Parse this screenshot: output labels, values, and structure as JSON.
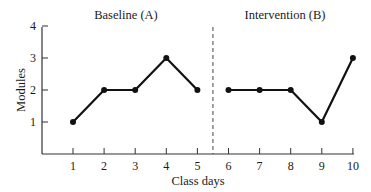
{
  "chart_data": {
    "type": "line",
    "title": "",
    "xlabel": "Class days",
    "ylabel": "Modules",
    "x": [
      1,
      2,
      3,
      4,
      5,
      6,
      7,
      8,
      9,
      10
    ],
    "series": [
      {
        "name": "Baseline (A)",
        "x": [
          1,
          2,
          3,
          4,
          5
        ],
        "values": [
          1,
          2,
          2,
          3,
          2
        ]
      },
      {
        "name": "Intervention (B)",
        "x": [
          6,
          7,
          8,
          9,
          10
        ],
        "values": [
          2,
          2,
          2,
          1,
          3
        ]
      }
    ],
    "phases": [
      {
        "label": "Baseline (A)",
        "start": 1,
        "end": 5
      },
      {
        "label": "Intervention (B)",
        "start": 6,
        "end": 10
      }
    ],
    "phase_change_line_x": 5.5,
    "xlim": [
      0,
      10
    ],
    "ylim": [
      0,
      4
    ],
    "xticks": [
      "1",
      "2",
      "3",
      "4",
      "5",
      "6",
      "7",
      "8",
      "9",
      "10"
    ],
    "yticks": [
      "1",
      "2",
      "3",
      "4"
    ],
    "grid": false,
    "legend": "none"
  },
  "labels": {
    "phase_a": "Baseline  (A)",
    "phase_b": "Intervention  (B)",
    "xlabel": "Class days",
    "ylabel": "Modules"
  },
  "colors": {
    "line": "#111111",
    "axis": "#333333",
    "phase_line": "#444444"
  }
}
